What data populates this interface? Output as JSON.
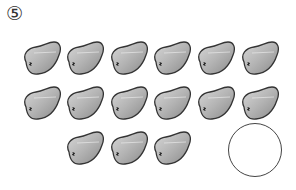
{
  "problem": {
    "number_label": "⑤",
    "object_name": "bean",
    "rows": [
      {
        "count": 6,
        "positions": [
          [
            20,
            40
          ],
          [
            63,
            40
          ],
          [
            107,
            40
          ],
          [
            150,
            40
          ],
          [
            194,
            40
          ],
          [
            238,
            40
          ]
        ]
      },
      {
        "count": 6,
        "positions": [
          [
            20,
            85
          ],
          [
            63,
            85
          ],
          [
            107,
            85
          ],
          [
            150,
            85
          ],
          [
            194,
            85
          ],
          [
            238,
            85
          ]
        ]
      },
      {
        "count": 3,
        "positions": [
          [
            63,
            130
          ],
          [
            107,
            130
          ],
          [
            150,
            130
          ]
        ]
      }
    ],
    "total_beans": 15,
    "answer_circle": {
      "value": ""
    }
  }
}
